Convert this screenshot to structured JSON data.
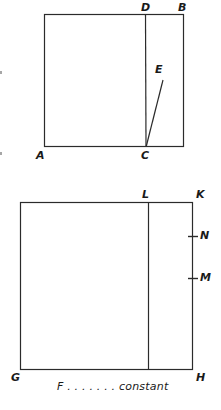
{
  "page": {
    "background_color": "#ffffff",
    "line_color": "#2b2b2b",
    "label_color": "#1a1a1a",
    "width": 221,
    "height": 410
  },
  "figures": [
    {
      "name": "upper-figure",
      "shape": "rectangle-with-internal-segment-and-ray",
      "rectangle": {
        "x": 44,
        "y": 14,
        "width": 140,
        "height": 133
      },
      "divider": {
        "x1": 145,
        "y1": 14,
        "x2": 146,
        "y2": 147
      },
      "ray": {
        "x1": 146,
        "y1": 147,
        "x2": 163,
        "y2": 80
      },
      "labels": [
        {
          "id": "A",
          "text": "A",
          "x": 36,
          "y": 151,
          "position": "bottom-left-corner"
        },
        {
          "id": "B",
          "text": "B",
          "x": 178,
          "y": 2,
          "position": "top-right-corner"
        },
        {
          "id": "C",
          "text": "C",
          "x": 141,
          "y": 151,
          "position": "bottom-on-divider"
        },
        {
          "id": "D",
          "text": "D",
          "x": 141,
          "y": 2,
          "position": "top-on-divider"
        },
        {
          "id": "E",
          "text": "E",
          "x": 155,
          "y": 64,
          "position": "ray-endpoint"
        }
      ]
    },
    {
      "name": "lower-figure",
      "shape": "rectangle-with-internal-segment-and-ticks",
      "rectangle": {
        "x": 20,
        "y": 202,
        "width": 173,
        "height": 168
      },
      "divider": {
        "x1": 148,
        "y1": 202,
        "x2": 148,
        "y2": 370
      },
      "ticks": [
        {
          "id": "N",
          "y": 236,
          "x1": 188,
          "x2": 198
        },
        {
          "id": "M",
          "y": 278,
          "x1": 188,
          "x2": 198
        }
      ],
      "labels": [
        {
          "id": "G",
          "text": "G",
          "x": 11,
          "y": 373,
          "position": "bottom-left-corner"
        },
        {
          "id": "H",
          "text": "H",
          "x": 197,
          "y": 373,
          "position": "bottom-right-corner"
        },
        {
          "id": "K",
          "text": "K",
          "x": 197,
          "y": 190,
          "position": "top-right-corner"
        },
        {
          "id": "L",
          "text": "L",
          "x": 143,
          "y": 190,
          "position": "top-on-divider"
        },
        {
          "id": "M",
          "text": "M",
          "x": 200,
          "y": 272,
          "position": "right-tick-lower"
        },
        {
          "id": "N",
          "text": "N",
          "x": 200,
          "y": 230,
          "position": "right-tick-upper"
        }
      ],
      "caption": {
        "text": "F . . . . . . . constant",
        "x": 57,
        "y": 381
      }
    }
  ],
  "artifacts": [
    {
      "name": "scan-speck-upper",
      "x": 0,
      "y": 71
    },
    {
      "name": "scan-speck-lower",
      "x": 0,
      "y": 152
    }
  ]
}
